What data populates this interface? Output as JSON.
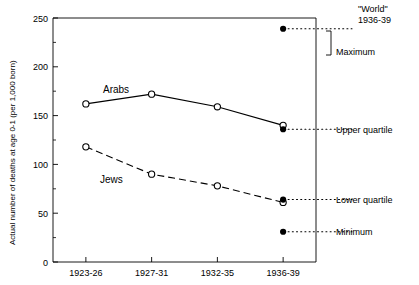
{
  "chart_data": {
    "type": "line",
    "title": "",
    "xlabel": "",
    "ylabel": "Actual number of deaths at age 0-1 (per 1,000 born)",
    "categories": [
      "1923-26",
      "1927-31",
      "1932-35",
      "1936-39"
    ],
    "ylim": [
      0,
      250
    ],
    "yticks": [
      0,
      50,
      100,
      150,
      200,
      250
    ],
    "yticks_minor": [
      25,
      75,
      125,
      175,
      225
    ],
    "grid": false,
    "legend": "inline-labels",
    "series": [
      {
        "name": "Arabs",
        "values": [
          162,
          172,
          159,
          140
        ],
        "style": "solid",
        "marker": "open-circle"
      },
      {
        "name": "Jews",
        "values": [
          118,
          90,
          78,
          61
        ],
        "style": "dashed",
        "marker": "open-circle"
      }
    ],
    "annotations": {
      "header": [
        "\"World\"",
        "1936-39"
      ],
      "reference_points": [
        {
          "label": "Maximum",
          "value": 239,
          "marker": "filled-circle",
          "leader": "dotted"
        },
        {
          "label": "Upper quartile",
          "value": 136,
          "marker": "filled-circle",
          "leader": "dotted"
        },
        {
          "label": "Lower quartile",
          "value": 64,
          "marker": "filled-circle",
          "leader": "dotted"
        },
        {
          "label": "Minimum",
          "value": 31,
          "marker": "filled-circle",
          "leader": "dotted"
        }
      ]
    },
    "colors": {
      "line": "#000000",
      "axis": "#000000",
      "background": "#ffffff"
    }
  }
}
